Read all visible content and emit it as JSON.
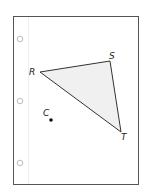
{
  "page": {
    "border_color": "#555555",
    "margin_line_color": "#eeeeee",
    "holes": [
      {
        "cx": 20,
        "cy": 39
      },
      {
        "cx": 20,
        "cy": 101
      },
      {
        "cx": 20,
        "cy": 163
      }
    ]
  },
  "triangle": {
    "fill": "#f0f0f0",
    "stroke": "#333333",
    "vertices": [
      {
        "name": "R",
        "x": 40,
        "y": 72
      },
      {
        "name": "S",
        "x": 110,
        "y": 61
      },
      {
        "name": "T",
        "x": 121,
        "y": 132
      }
    ]
  },
  "labels": {
    "R": "R",
    "S": "S",
    "T": "T",
    "C": "C"
  },
  "point_c": {
    "x": 51,
    "y": 120
  }
}
